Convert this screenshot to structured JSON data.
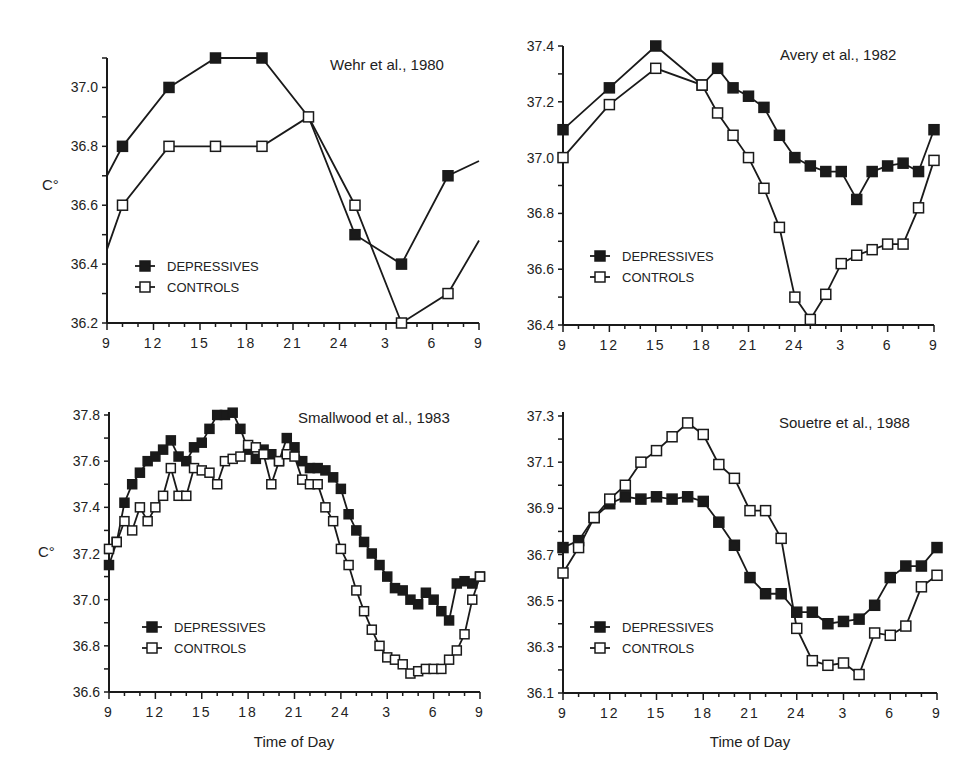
{
  "figure": {
    "y_unit_label": "C°",
    "x_axis_title": "Time of Day",
    "legend": {
      "depressives": "DEPRESSIVES",
      "controls": "CONTROLS"
    }
  },
  "chart_data": [
    {
      "type": "line",
      "title": "Wehr et al., 1980",
      "xlabel": "",
      "ylabel": "C°",
      "x_ticks": [
        "9",
        "12",
        "15",
        "18",
        "21",
        "24",
        "3",
        "6",
        "9"
      ],
      "y_ticks": [
        "36.2",
        "36.4",
        "36.6",
        "36.8",
        "37.0"
      ],
      "ylim": [
        36.2,
        37.1
      ],
      "grid": false,
      "legend_position": "lower-left",
      "series": [
        {
          "name": "DEPRESSIVES",
          "marker": "filled-square",
          "x": [
            9,
            10,
            13,
            16,
            19,
            22,
            25,
            28,
            31,
            33
          ],
          "values": [
            36.7,
            36.8,
            37.0,
            37.1,
            37.1,
            36.9,
            36.5,
            36.4,
            36.7,
            36.75
          ],
          "markers_at": [
            1,
            2,
            3,
            4,
            6,
            7,
            8
          ]
        },
        {
          "name": "CONTROLS",
          "marker": "open-square",
          "x": [
            9,
            10,
            13,
            16,
            19,
            22,
            25,
            28,
            31,
            33
          ],
          "values": [
            36.45,
            36.6,
            36.8,
            36.8,
            36.8,
            36.9,
            36.6,
            36.2,
            36.3,
            36.48
          ],
          "markers_at": [
            1,
            2,
            3,
            4,
            5,
            6,
            7,
            8
          ]
        }
      ]
    },
    {
      "type": "line",
      "title": "Avery et al., 1982",
      "xlabel": "",
      "ylabel": "",
      "x_ticks": [
        "9",
        "12",
        "15",
        "18",
        "21",
        "24",
        "3",
        "6",
        "9"
      ],
      "y_ticks": [
        "36.4",
        "36.6",
        "36.8",
        "37.0",
        "37.2",
        "37.4"
      ],
      "ylim": [
        36.4,
        37.4
      ],
      "grid": false,
      "legend_position": "lower-left",
      "series": [
        {
          "name": "DEPRESSIVES",
          "marker": "filled-square",
          "x": [
            9,
            12,
            15,
            18,
            19,
            20,
            21,
            22,
            23,
            24,
            25,
            26,
            27,
            28,
            29,
            30,
            31,
            32,
            33
          ],
          "values": [
            37.1,
            37.25,
            37.4,
            37.26,
            37.32,
            37.25,
            37.22,
            37.18,
            37.08,
            37.0,
            36.97,
            36.95,
            36.95,
            36.85,
            36.95,
            36.97,
            36.98,
            36.95,
            37.1
          ],
          "markers_at": "all"
        },
        {
          "name": "CONTROLS",
          "marker": "open-square",
          "x": [
            9,
            12,
            15,
            18,
            19,
            20,
            21,
            22,
            23,
            24,
            25,
            26,
            27,
            28,
            29,
            30,
            31,
            32,
            33
          ],
          "values": [
            37.0,
            37.19,
            37.32,
            37.26,
            37.16,
            37.08,
            37.0,
            36.89,
            36.75,
            36.5,
            36.42,
            36.51,
            36.62,
            36.65,
            36.67,
            36.69,
            36.69,
            36.82,
            36.99
          ],
          "markers_at": "all"
        }
      ]
    },
    {
      "type": "line",
      "title": "Smallwood et al., 1983",
      "xlabel": "Time of Day",
      "ylabel": "C°",
      "x_ticks": [
        "9",
        "12",
        "15",
        "18",
        "21",
        "24",
        "3",
        "6",
        "9"
      ],
      "y_ticks": [
        "36.6",
        "36.8",
        "37.0",
        "37.2",
        "37.4",
        "37.6",
        "37.8"
      ],
      "ylim": [
        36.6,
        37.8
      ],
      "grid": false,
      "legend_position": "lower-left",
      "series": [
        {
          "name": "DEPRESSIVES",
          "marker": "filled-square",
          "x": [
            9,
            9.5,
            10,
            10.5,
            11,
            11.5,
            12,
            12.5,
            13,
            13.5,
            14,
            14.5,
            15,
            15.5,
            16,
            16.5,
            17,
            17.5,
            18,
            18.5,
            19,
            19.5,
            20,
            20.5,
            21,
            21.5,
            22,
            22.5,
            23,
            23.5,
            24,
            24.5,
            25,
            25.5,
            26,
            26.5,
            27,
            27.5,
            28,
            28.5,
            29,
            29.5,
            30,
            30.5,
            31,
            31.5,
            32,
            32.5,
            33
          ],
          "values": [
            37.15,
            37.25,
            37.42,
            37.5,
            37.55,
            37.6,
            37.62,
            37.65,
            37.69,
            37.62,
            37.6,
            37.66,
            37.68,
            37.74,
            37.8,
            37.8,
            37.81,
            37.74,
            37.65,
            37.61,
            37.65,
            37.63,
            37.6,
            37.7,
            37.66,
            37.6,
            37.57,
            37.57,
            37.56,
            37.53,
            37.48,
            37.37,
            37.3,
            37.25,
            37.2,
            37.15,
            37.1,
            37.05,
            37.04,
            37.0,
            36.98,
            37.03,
            37.0,
            36.95,
            36.91,
            37.07,
            37.08,
            37.07,
            37.1
          ],
          "markers_at": "all"
        },
        {
          "name": "CONTROLS",
          "marker": "open-square",
          "x": [
            9,
            9.5,
            10,
            10.5,
            11,
            11.5,
            12,
            12.5,
            13,
            13.5,
            14,
            14.5,
            15,
            15.5,
            16,
            16.5,
            17,
            17.5,
            18,
            18.5,
            19,
            19.5,
            20,
            20.5,
            21,
            21.5,
            22,
            22.5,
            23,
            23.5,
            24,
            24.5,
            25,
            25.5,
            26,
            26.5,
            27,
            27.5,
            28,
            28.5,
            29,
            29.5,
            30,
            30.5,
            31,
            31.5,
            32,
            32.5,
            33
          ],
          "values": [
            37.22,
            37.25,
            37.34,
            37.3,
            37.4,
            37.34,
            37.4,
            37.45,
            37.57,
            37.45,
            37.45,
            37.57,
            37.56,
            37.55,
            37.5,
            37.6,
            37.61,
            37.62,
            37.67,
            37.66,
            37.63,
            37.5,
            37.6,
            37.63,
            37.62,
            37.52,
            37.5,
            37.5,
            37.4,
            37.34,
            37.22,
            37.15,
            37.04,
            36.95,
            36.87,
            36.8,
            36.75,
            36.74,
            36.72,
            36.68,
            36.69,
            36.7,
            36.7,
            36.7,
            36.74,
            36.78,
            36.85,
            37.0,
            37.1
          ],
          "markers_at": "all"
        }
      ]
    },
    {
      "type": "line",
      "title": "Souetre et al., 1988",
      "xlabel": "Time of Day",
      "ylabel": "",
      "x_ticks": [
        "9",
        "12",
        "15",
        "18",
        "21",
        "24",
        "3",
        "6",
        "9"
      ],
      "y_ticks": [
        "36.1",
        "36.3",
        "36.5",
        "36.7",
        "36.9",
        "37.1",
        "37.3"
      ],
      "ylim": [
        36.1,
        37.3
      ],
      "grid": false,
      "legend_position": "lower-left",
      "series": [
        {
          "name": "DEPRESSIVES",
          "marker": "filled-square",
          "x": [
            9,
            10,
            11,
            12,
            13,
            14,
            15,
            16,
            17,
            18,
            19,
            20,
            21,
            22,
            23,
            24,
            25,
            26,
            27,
            28,
            29,
            30,
            31,
            32,
            33
          ],
          "values": [
            36.73,
            36.76,
            36.86,
            36.92,
            36.95,
            36.94,
            36.95,
            36.94,
            36.95,
            36.93,
            36.84,
            36.74,
            36.6,
            36.53,
            36.53,
            36.45,
            36.45,
            36.4,
            36.41,
            36.42,
            36.48,
            36.6,
            36.65,
            36.65,
            36.73
          ],
          "markers_at": "all"
        },
        {
          "name": "CONTROLS",
          "marker": "open-square",
          "x": [
            9,
            10,
            11,
            12,
            13,
            14,
            15,
            16,
            17,
            18,
            19,
            20,
            21,
            22,
            23,
            24,
            25,
            26,
            27,
            28,
            29,
            30,
            31,
            32,
            33
          ],
          "values": [
            36.62,
            36.73,
            36.86,
            36.94,
            37.0,
            37.1,
            37.15,
            37.21,
            37.27,
            37.22,
            37.09,
            37.03,
            36.89,
            36.89,
            36.77,
            36.38,
            36.24,
            36.22,
            36.23,
            36.18,
            36.36,
            36.35,
            36.39,
            36.56,
            36.61
          ],
          "markers_at": "all"
        }
      ]
    }
  ],
  "panels": [
    {
      "title": "Wehr et al., 1980"
    },
    {
      "title": "Avery et al., 1982"
    },
    {
      "title": "Smallwood et al., 1983"
    },
    {
      "title": "Souetre et al., 1988"
    }
  ]
}
